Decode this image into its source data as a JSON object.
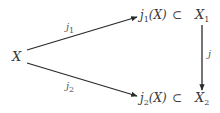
{
  "diagram": {
    "type": "commutative-diagram",
    "nodes": {
      "source": {
        "base": "X"
      },
      "top_image": {
        "func": "j",
        "sub": "1",
        "arg": "(X)"
      },
      "top_subset": "⊂",
      "top_target": {
        "base": "X",
        "sub": "1"
      },
      "bottom_image": {
        "func": "j",
        "sub": "2",
        "arg": "(X)"
      },
      "bottom_subset": "⊂",
      "bottom_target": {
        "base": "X",
        "sub": "2"
      }
    },
    "arrows": {
      "upper": {
        "base": "j",
        "sub": "1",
        "from": "X",
        "to": "j1(X)"
      },
      "lower": {
        "base": "j",
        "sub": "2",
        "from": "X",
        "to": "j2(X)"
      },
      "vertical": {
        "base": "j",
        "sub": "",
        "from": "X1",
        "to": "X2"
      }
    },
    "colors": {
      "stroke": "#2a2a2a",
      "text": "#3a3a3a"
    }
  }
}
